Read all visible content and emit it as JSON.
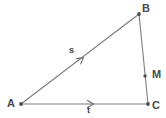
{
  "figure": {
    "type": "geometry-diagram",
    "width": 166,
    "height": 118,
    "background_color": "#ffffff",
    "stroke_color": "#7d7d7d",
    "stroke_color_dark": "#5a5a5a",
    "label_color": "#4a4a4a",
    "stroke_width": 1
  },
  "vertices": [
    {
      "id": "A",
      "label": "A",
      "x": 21,
      "y": 104
    },
    {
      "id": "B",
      "label": "B",
      "x": 139,
      "y": 14
    },
    {
      "id": "C",
      "label": "C",
      "x": 148,
      "y": 104
    }
  ],
  "points": [
    {
      "id": "M",
      "label": "M",
      "x": 145,
      "y": 76,
      "on_segment": "BC"
    }
  ],
  "segments": [
    {
      "id": "AB",
      "from": "A",
      "to": "B",
      "vector_label": "s",
      "arrow": true
    },
    {
      "id": "AC",
      "from": "A",
      "to": "C",
      "vector_label": "t",
      "arrow": true
    },
    {
      "id": "BC",
      "from": "B",
      "to": "C",
      "vector_label": "",
      "arrow": false
    }
  ],
  "vector_labels": [
    {
      "id": "s",
      "label": "s",
      "segment": "AB",
      "x": 72,
      "y": 50
    },
    {
      "id": "t",
      "label": "t",
      "segment": "AC",
      "x": 90,
      "y": 111
    }
  ],
  "arrowheads": [
    {
      "id": "s-arrowhead",
      "segment": "AB",
      "x": 83,
      "y": 58,
      "angle_deg": -37.3
    },
    {
      "id": "t-arrowhead",
      "segment": "AC",
      "x": 92,
      "y": 103,
      "angle_deg": 0
    }
  ]
}
